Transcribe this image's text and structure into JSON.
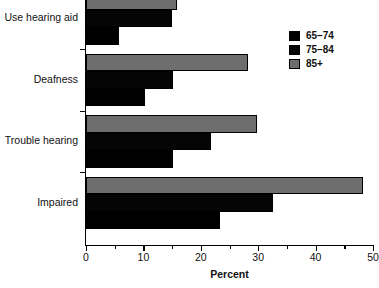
{
  "chart_data": {
    "type": "bar",
    "orientation": "horizontal",
    "title": "",
    "subtitle": "",
    "xlabel": "Percent",
    "ylabel": "",
    "xlim": [
      0,
      50
    ],
    "xticks": [
      0,
      10,
      20,
      30,
      40,
      50
    ],
    "xtick_labels": [
      "0",
      "10",
      "20",
      "30",
      "40",
      "50"
    ],
    "minor_xticks": [
      5,
      15,
      25,
      35,
      45
    ],
    "grid": false,
    "legend_position": "top-right",
    "categories": [
      "Use hearing aid",
      "Deafness",
      "Trouble hearing",
      "Impaired"
    ],
    "series": [
      {
        "name": "65–74",
        "color": "#000000",
        "values": [
          5.7,
          10.3,
          15.2,
          23.3
        ]
      },
      {
        "name": "75–84",
        "color": "#050505",
        "values": [
          15.0,
          15.2,
          21.8,
          32.6
        ]
      },
      {
        "name": "85+",
        "color": "#6e6e6e",
        "values": [
          15.9,
          28.2,
          29.8,
          48.3
        ]
      }
    ]
  },
  "axis": {
    "x_title": "Percent"
  },
  "legend": {
    "entries": [
      {
        "label": "65–74"
      },
      {
        "label": "75–84"
      },
      {
        "label": "85+"
      }
    ]
  }
}
